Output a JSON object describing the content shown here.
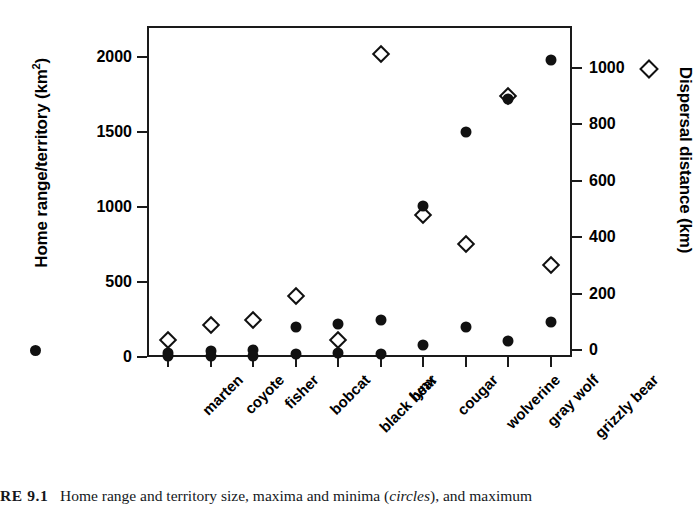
{
  "chart_data": {
    "type": "scatter",
    "title": "",
    "categories": [
      "marten",
      "coyote",
      "fisher",
      "bobcat",
      "black bear",
      "lynx",
      "cougar",
      "wolverine",
      "gray wolf",
      "grizzly bear"
    ],
    "series": [
      {
        "name": "Home range/territory maxima",
        "marker": "filled-circle",
        "axis": "left",
        "units": "km2",
        "values": [
          30,
          40,
          45,
          200,
          220,
          250,
          1010,
          1500,
          1720,
          1980
        ]
      },
      {
        "name": "Home range/territory minima",
        "marker": "filled-circle",
        "axis": "left",
        "units": "km2",
        "values": [
          5,
          10,
          10,
          20,
          25,
          20,
          80,
          200,
          110,
          235
        ]
      },
      {
        "name": "Maximum dispersal distance",
        "marker": "open-diamond",
        "axis": "right",
        "units": "km",
        "values": [
          35,
          90,
          105,
          190,
          35,
          1050,
          480,
          375,
          900,
          300
        ]
      }
    ],
    "left_axis": {
      "label": "Home range/territory (km2)",
      "label_base": "Home range/territory (km",
      "label_sup": "2",
      "label_tail": ")",
      "ticks": [
        0,
        500,
        1000,
        1500,
        2000
      ],
      "tick_labels": [
        "0",
        "500",
        "1000",
        "1500",
        "2000"
      ],
      "ylim": [
        0,
        2207
      ]
    },
    "right_axis": {
      "label": "Dispersal distance (km)",
      "ticks": [
        0,
        200,
        400,
        600,
        800,
        1000
      ],
      "tick_labels": [
        "0",
        "200",
        "400",
        "600",
        "800",
        "1000"
      ],
      "ylim": [
        0,
        1175
      ]
    },
    "xlabel": "",
    "grid": false,
    "legend": {
      "position": "outside",
      "circle_key": "filled circle = home range/territory maxima and minima",
      "diamond_key": "open diamond = maximum dispersal distance"
    }
  },
  "caption": {
    "label": "RE 9.1",
    "text_part1": "Home range and territory size, maxima and minima (",
    "text_italic": "circles",
    "text_part2": "), and maximum"
  }
}
